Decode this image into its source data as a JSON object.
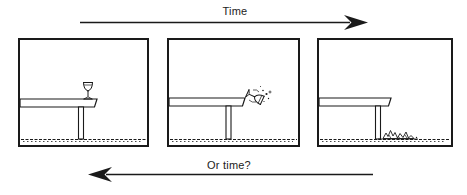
{
  "figure": {
    "top_arrow": {
      "label": "Time",
      "direction": "right"
    },
    "bottom_arrow": {
      "label": "Or time?",
      "direction": "left"
    },
    "panels": [
      {
        "scene": "wine-glass-standing-on-table-edge"
      },
      {
        "scene": "wine-glass-falling-off-table"
      },
      {
        "scene": "wine-glass-shattered-on-floor"
      }
    ],
    "colors": {
      "ink": "#1a1a1a",
      "background": "#ffffff"
    }
  }
}
